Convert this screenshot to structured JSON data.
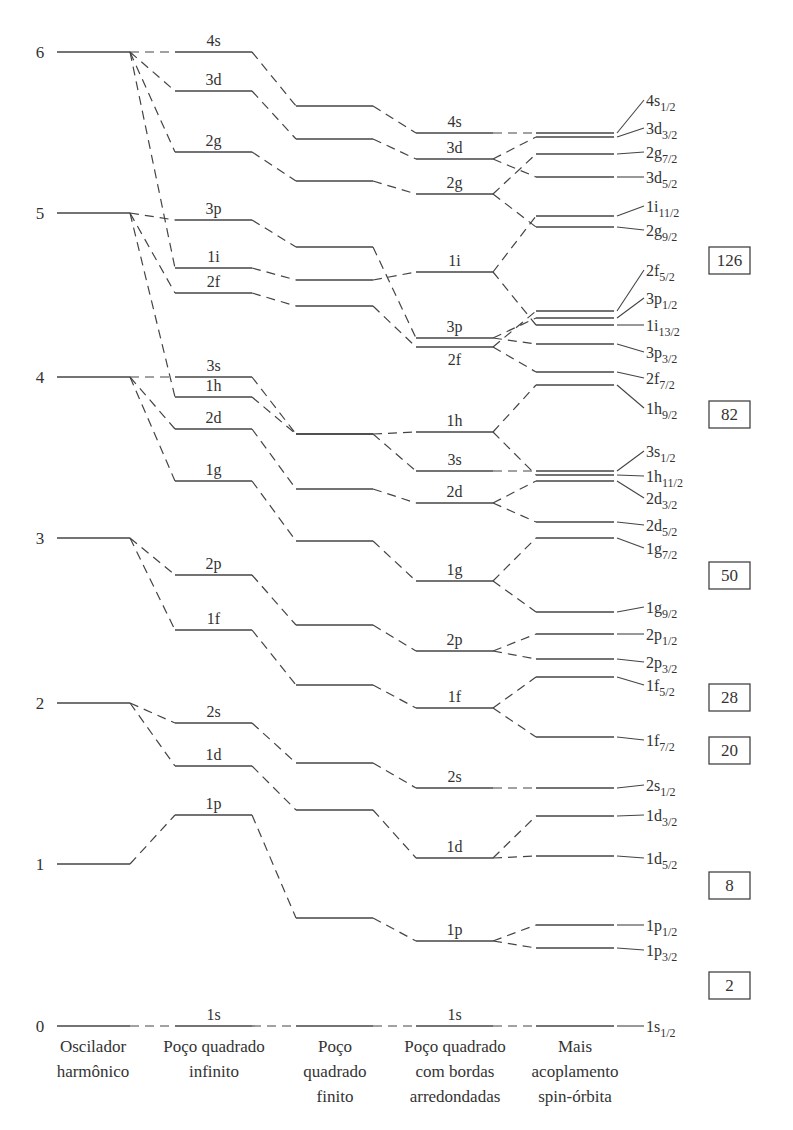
{
  "chart_data": {
    "type": "diagram",
    "y_axis_ticks": [
      "0",
      "1",
      "2",
      "3",
      "4",
      "5",
      "6"
    ],
    "columns": [
      {
        "id": "osc",
        "label_lines": [
          "Oscilador",
          "harmônico"
        ]
      },
      {
        "id": "inf",
        "label_lines": [
          "Poço quadrado",
          "infinito"
        ]
      },
      {
        "id": "fin",
        "label_lines": [
          "Poço",
          "quadrado",
          "finito"
        ]
      },
      {
        "id": "rnd",
        "label_lines": [
          "Poço quadrado",
          "com bordas",
          "arredondadas"
        ]
      },
      {
        "id": "so",
        "label_lines": [
          "Mais",
          "acoplamento",
          "spin-órbita"
        ]
      }
    ],
    "oscillator_levels": [
      {
        "n": "6",
        "y": 52
      },
      {
        "n": "5",
        "y": 213
      },
      {
        "n": "4",
        "y": 377
      },
      {
        "n": "3",
        "y": 538
      },
      {
        "n": "2",
        "y": 703
      },
      {
        "n": "1",
        "y": 864
      },
      {
        "n": "0",
        "y": 1026
      }
    ],
    "levels": [
      {
        "name": "4s",
        "osc": 6,
        "inf": 52,
        "fin": 106,
        "rnd": 133,
        "so": [
          {
            "label": "4s",
            "sub": "1/2",
            "y": 133,
            "ly": 100
          }
        ]
      },
      {
        "name": "3d",
        "osc": 6,
        "inf": 91,
        "fin": 139,
        "rnd": 159,
        "so": [
          {
            "label": "3d",
            "sub": "3/2",
            "y": 137,
            "ly": 128
          },
          {
            "label": "3d",
            "sub": "5/2",
            "y": 177,
            "ly": 177
          }
        ]
      },
      {
        "name": "2g",
        "osc": 6,
        "inf": 152,
        "fin": 181,
        "rnd": 194,
        "so": [
          {
            "label": "2g",
            "sub": "7/2",
            "y": 154,
            "ly": 152
          },
          {
            "label": "2g",
            "sub": "9/2",
            "y": 227,
            "ly": 230
          }
        ]
      },
      {
        "name": "3p",
        "osc": 5,
        "inf": 220,
        "fin": 247,
        "rnd": 338,
        "so": [
          {
            "label": "3p",
            "sub": "1/2",
            "y": 318,
            "ly": 298
          },
          {
            "label": "3p",
            "sub": "3/2",
            "y": 344,
            "ly": 352
          }
        ]
      },
      {
        "name": "1i",
        "osc": 6,
        "inf": 268,
        "fin": 280,
        "rnd": 272,
        "so": [
          {
            "label": "1i",
            "sub": "11/2",
            "y": 216,
            "ly": 206
          },
          {
            "label": "1i",
            "sub": "13/2",
            "y": 325,
            "ly": 325
          }
        ]
      },
      {
        "name": "2f",
        "osc": 5,
        "inf": 293,
        "fin": 306,
        "rnd": 347,
        "so": [
          {
            "label": "2f",
            "sub": "5/2",
            "y": 311,
            "ly": 270
          },
          {
            "label": "2f",
            "sub": "7/2",
            "y": 372,
            "ly": 378
          }
        ]
      },
      {
        "name": "3s",
        "osc": 4,
        "inf": 377,
        "fin": 434,
        "rnd": 471,
        "so": [
          {
            "label": "3s",
            "sub": "1/2",
            "y": 471,
            "ly": 451
          }
        ]
      },
      {
        "name": "1h",
        "osc": 5,
        "inf": 397,
        "fin": 434,
        "rnd": 432,
        "so": [
          {
            "label": "1h",
            "sub": "9/2",
            "y": 385,
            "ly": 408
          },
          {
            "label": "1h",
            "sub": "11/2",
            "y": 475,
            "ly": 476
          }
        ]
      },
      {
        "name": "2d",
        "osc": 4,
        "inf": 429,
        "fin": 489,
        "rnd": 503,
        "so": [
          {
            "label": "2d",
            "sub": "3/2",
            "y": 481,
            "ly": 498
          },
          {
            "label": "2d",
            "sub": "5/2",
            "y": 522,
            "ly": 525
          }
        ]
      },
      {
        "name": "1g",
        "osc": 4,
        "inf": 481,
        "fin": 541,
        "rnd": 581,
        "so": [
          {
            "label": "1g",
            "sub": "7/2",
            "y": 538,
            "ly": 548
          },
          {
            "label": "1g",
            "sub": "9/2",
            "y": 612,
            "ly": 607
          }
        ]
      },
      {
        "name": "2p",
        "osc": 3,
        "inf": 575,
        "fin": 625,
        "rnd": 651,
        "so": [
          {
            "label": "2p",
            "sub": "1/2",
            "y": 634,
            "ly": 634
          },
          {
            "label": "2p",
            "sub": "3/2",
            "y": 659,
            "ly": 662
          }
        ]
      },
      {
        "name": "1f",
        "osc": 3,
        "inf": 630,
        "fin": 685,
        "rnd": 708,
        "so": [
          {
            "label": "1f",
            "sub": "5/2",
            "y": 677,
            "ly": 685
          },
          {
            "label": "1f",
            "sub": "7/2",
            "y": 737,
            "ly": 740
          }
        ]
      },
      {
        "name": "2s",
        "osc": 2,
        "inf": 723,
        "fin": 763,
        "rnd": 788,
        "so": [
          {
            "label": "2s",
            "sub": "1/2",
            "y": 788,
            "ly": 785
          }
        ]
      },
      {
        "name": "1d",
        "osc": 2,
        "inf": 766,
        "fin": 810,
        "rnd": 858,
        "so": [
          {
            "label": "1d",
            "sub": "3/2",
            "y": 816,
            "ly": 815
          },
          {
            "label": "1d",
            "sub": "5/2",
            "y": 856,
            "ly": 858
          }
        ]
      },
      {
        "name": "1p",
        "osc": 1,
        "inf": 815,
        "fin": 918,
        "rnd": 941,
        "so": [
          {
            "label": "1p",
            "sub": "1/2",
            "y": 925,
            "ly": 925
          },
          {
            "label": "1p",
            "sub": "3/2",
            "y": 948,
            "ly": 950
          }
        ]
      },
      {
        "name": "1s",
        "osc": 0,
        "inf": 1026,
        "fin": 1026,
        "rnd": 1026,
        "so": [
          {
            "label": "1s",
            "sub": "1/2",
            "y": 1026,
            "ly": 1026
          }
        ]
      }
    ],
    "magic_numbers": [
      {
        "value": "126",
        "y": 260
      },
      {
        "value": "82",
        "y": 414
      },
      {
        "value": "50",
        "y": 575
      },
      {
        "value": "28",
        "y": 697
      },
      {
        "value": "20",
        "y": 750
      },
      {
        "value": "8",
        "y": 885
      },
      {
        "value": "2",
        "y": 985
      }
    ]
  }
}
